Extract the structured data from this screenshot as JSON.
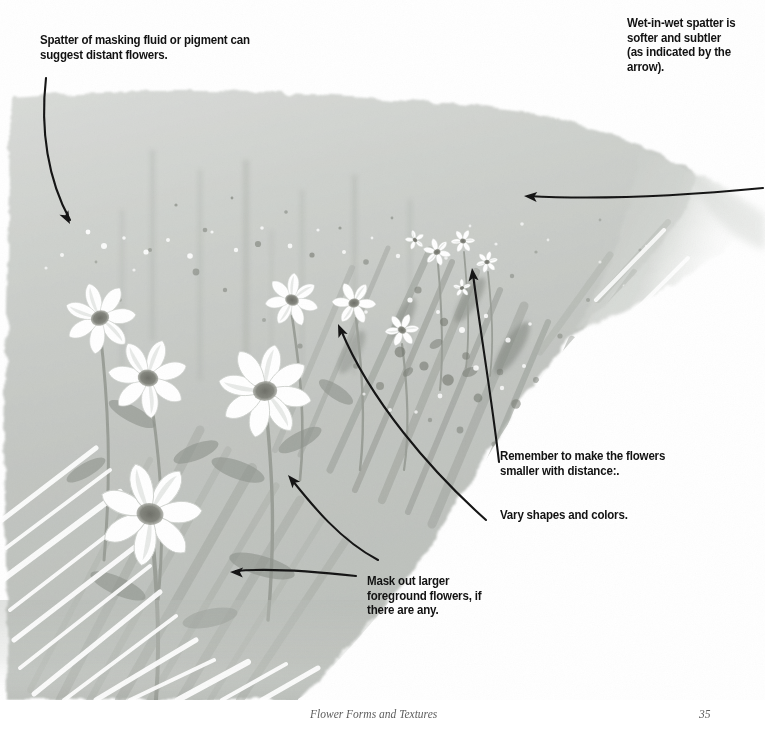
{
  "page": {
    "title": "Flower Forms and Textures",
    "page_number": "35",
    "type": "watercolor-instruction-illustration"
  },
  "annotations": [
    {
      "id": "spatter",
      "text": "Spatter of masking fluid or pigment can suggest distant flowers.",
      "arrow": "curves down-right from text into the upper-left wash"
    },
    {
      "id": "wet-in-wet",
      "text": "Wet-in-wet spatter is softer and subtler (as indicated by the arrow).",
      "arrow": "long horizontal arrow pointing left into the soft right wash"
    },
    {
      "id": "remember",
      "text": "Remember to make the flowers smaller with distance:.",
      "arrow": "two long curved arrows pointing up-left to the small distant flowers"
    },
    {
      "id": "vary",
      "text": "Vary shapes and colors.",
      "arrow": "none"
    },
    {
      "id": "mask",
      "text": "Mask out larger foreground flowers, if there are any.",
      "arrow": "arrow pointing left to the large foreground daisy"
    }
  ],
  "artwork": {
    "description": "Grey watercolor wash field with white daisy-like flowers, dry-brush grass strokes and spatter texture",
    "palette": {
      "wash_light": "#d4d6d3",
      "wash_mid": "#c2c5c1",
      "wash_dark": "#a9ada8",
      "stroke_dark": "#8d918c",
      "spatter_dark": "#6f736e",
      "flower_white": "#ffffff",
      "flower_center": "#7a7b74",
      "ink": "#121212",
      "paper": "#ffffff"
    },
    "flowers": [
      {
        "cx": 100,
        "cy": 318,
        "r": 36,
        "petals": 7,
        "rot": -18,
        "size": "large"
      },
      {
        "cx": 148,
        "cy": 378,
        "r": 40,
        "petals": 7,
        "rot": 12,
        "size": "large"
      },
      {
        "cx": 265,
        "cy": 391,
        "r": 47,
        "petals": 8,
        "rot": -6,
        "size": "large"
      },
      {
        "cx": 150,
        "cy": 514,
        "r": 52,
        "petals": 7,
        "rot": 8,
        "size": "large"
      },
      {
        "cx": 292,
        "cy": 300,
        "r": 27,
        "petals": 7,
        "rot": 20,
        "size": "medium"
      },
      {
        "cx": 354,
        "cy": 303,
        "r": 22,
        "petals": 6,
        "rot": -12,
        "size": "medium"
      },
      {
        "cx": 402,
        "cy": 330,
        "r": 17,
        "petals": 6,
        "rot": 30,
        "size": "small"
      },
      {
        "cx": 437,
        "cy": 252,
        "r": 14,
        "petals": 6,
        "rot": -20,
        "size": "small"
      },
      {
        "cx": 463,
        "cy": 241,
        "r": 12,
        "petals": 6,
        "rot": 15,
        "size": "small"
      },
      {
        "cx": 487,
        "cy": 262,
        "r": 11,
        "petals": 6,
        "rot": -5,
        "size": "small"
      },
      {
        "cx": 415,
        "cy": 240,
        "r": 10,
        "petals": 5,
        "rot": 40,
        "size": "small"
      },
      {
        "cx": 462,
        "cy": 288,
        "r": 9,
        "petals": 5,
        "rot": -30,
        "size": "small"
      }
    ],
    "arrows": [
      {
        "id": "arrow-spatter",
        "path": "M46,78 C40,130 48,180 70,220",
        "head_at": [
          70,
          224
        ],
        "head_angle": 62
      },
      {
        "id": "arrow-wetinwet",
        "path": "M763,188 C690,195 600,200 528,196",
        "head_at": [
          524,
          196
        ],
        "head_angle": 184
      },
      {
        "id": "arrow-remember-1",
        "path": "M499,462 C492,400 480,330 473,274",
        "head_at": [
          472,
          268
        ],
        "head_angle": -97
      },
      {
        "id": "arrow-remember-2",
        "path": "M486,520 C430,470 370,400 341,330",
        "head_at": [
          338,
          324
        ],
        "head_angle": -113
      },
      {
        "id": "arrow-mask-upper",
        "path": "M378,560 C340,540 312,505 292,480",
        "head_at": [
          288,
          475
        ],
        "head_angle": -130
      },
      {
        "id": "arrow-mask-lower",
        "path": "M356,576 C320,572 270,568 236,571",
        "head_at": [
          230,
          572
        ],
        "head_angle": 182
      }
    ]
  }
}
